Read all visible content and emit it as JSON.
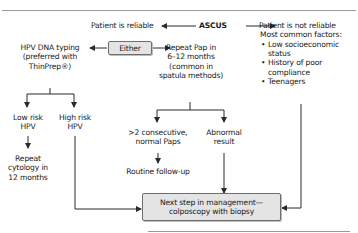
{
  "diagram": {
    "root": "ASCUS",
    "left_branch": {
      "label": "Patient is reliable",
      "either": "Either",
      "option_a": {
        "text_lines": [
          "HPV DNA typing",
          "(preferred with",
          "ThinPrep®)"
        ],
        "low_risk": {
          "lines": [
            "Low risk",
            "HPV"
          ],
          "outcome_lines": [
            "Repeat",
            "cytology in",
            "12 months"
          ]
        },
        "high_risk": {
          "lines": [
            "High risk",
            "HPV"
          ]
        }
      },
      "option_b": {
        "text_lines": [
          "Repeat Pap in",
          "6–12 months",
          "(common in",
          "spatula methods)"
        ],
        "normal": {
          "lines": [
            ">2 consecutive,",
            "normal Paps"
          ],
          "outcome": "Routine follow-up"
        },
        "abnormal": {
          "lines": [
            "Abnormal",
            "result"
          ]
        }
      }
    },
    "right_branch": {
      "label": "Patient is not reliable",
      "factors_heading": "Most common factors:",
      "factors": [
        "Low socioeconomic",
        "status",
        "History of poor",
        "compliance",
        "Teenagers"
      ]
    },
    "final": {
      "lines": [
        "Next step in management—",
        "colposcopy with biopsy"
      ]
    }
  },
  "colors": {
    "line": "#2a2a2a",
    "box_fill": "#e4e4e4",
    "box_border": "#6e6e6e",
    "rule": "#9a9a9a"
  }
}
